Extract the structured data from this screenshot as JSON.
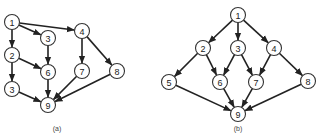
{
  "diagrams": [
    {
      "id": "a",
      "caption": "(a)",
      "caption_pos": [
        57,
        131
      ],
      "nodes": [
        {
          "key": "n1",
          "label": "1",
          "x": 12,
          "y": 22
        },
        {
          "key": "n3a",
          "label": "3",
          "x": 48,
          "y": 38
        },
        {
          "key": "n4",
          "label": "4",
          "x": 82,
          "y": 31
        },
        {
          "key": "n2",
          "label": "2",
          "x": 12,
          "y": 55
        },
        {
          "key": "n6",
          "label": "6",
          "x": 48,
          "y": 72
        },
        {
          "key": "n7",
          "label": "7",
          "x": 82,
          "y": 71
        },
        {
          "key": "n8",
          "label": "8",
          "x": 117,
          "y": 71
        },
        {
          "key": "n3b",
          "label": "3",
          "x": 12,
          "y": 89
        },
        {
          "key": "n9",
          "label": "9",
          "x": 48,
          "y": 105
        }
      ],
      "edges": [
        [
          "n1",
          "n2"
        ],
        [
          "n1",
          "n3a"
        ],
        [
          "n1",
          "n4"
        ],
        [
          "n3a",
          "n6"
        ],
        [
          "n2",
          "n6"
        ],
        [
          "n2",
          "n3b"
        ],
        [
          "n4",
          "n7"
        ],
        [
          "n4",
          "n8"
        ],
        [
          "n6",
          "n9"
        ],
        [
          "n3b",
          "n9"
        ],
        [
          "n7",
          "n9"
        ],
        [
          "n8",
          "n9"
        ]
      ]
    },
    {
      "id": "b",
      "caption": "(b)",
      "caption_pos": [
        238,
        131
      ],
      "nodes": [
        {
          "key": "n1",
          "label": "1",
          "x": 238,
          "y": 15
        },
        {
          "key": "n2",
          "label": "2",
          "x": 203,
          "y": 48
        },
        {
          "key": "n3",
          "label": "3",
          "x": 238,
          "y": 48
        },
        {
          "key": "n4",
          "label": "4",
          "x": 274,
          "y": 48
        },
        {
          "key": "n5",
          "label": "5",
          "x": 169,
          "y": 82
        },
        {
          "key": "n6",
          "label": "6",
          "x": 220,
          "y": 82
        },
        {
          "key": "n7",
          "label": "7",
          "x": 256,
          "y": 82
        },
        {
          "key": "n8",
          "label": "8",
          "x": 308,
          "y": 81
        },
        {
          "key": "n9",
          "label": "9",
          "x": 238,
          "y": 114
        }
      ],
      "edges": [
        [
          "n1",
          "n2"
        ],
        [
          "n1",
          "n3"
        ],
        [
          "n1",
          "n4"
        ],
        [
          "n2",
          "n5"
        ],
        [
          "n2",
          "n6"
        ],
        [
          "n3",
          "n6"
        ],
        [
          "n3",
          "n7"
        ],
        [
          "n4",
          "n7"
        ],
        [
          "n4",
          "n8"
        ],
        [
          "n5",
          "n9"
        ],
        [
          "n6",
          "n9"
        ],
        [
          "n7",
          "n9"
        ],
        [
          "n8",
          "n9"
        ]
      ]
    }
  ],
  "style": {
    "node_radius": 7.5,
    "stroke_color": "#222222",
    "background": "#ffffff"
  }
}
